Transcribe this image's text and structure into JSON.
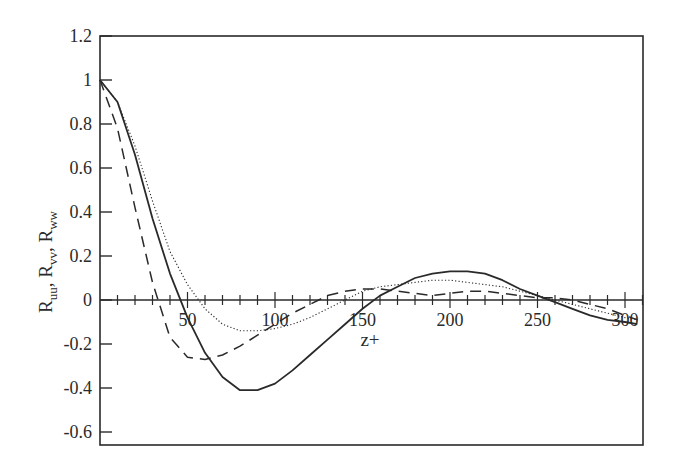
{
  "chart_data": {
    "type": "line",
    "title": "",
    "xlabel": "z+",
    "ylabel": "R_uu, R_vv, R_ww",
    "ylabel_parts": [
      {
        "base": "R",
        "sub": "uu",
        "sep": ", "
      },
      {
        "base": "R",
        "sub": "vv",
        "sep": ", "
      },
      {
        "base": "R",
        "sub": "ww",
        "sep": ""
      }
    ],
    "xlim": [
      0,
      310
    ],
    "ylim": [
      -0.65,
      1.2
    ],
    "grid": false,
    "legend": "none",
    "x_ticks": [
      50,
      100,
      150,
      200,
      250,
      300
    ],
    "x_tick_labels": [
      "50",
      "100",
      "150",
      "200",
      "250",
      "300"
    ],
    "x_minor_tick_step": 10,
    "y_ticks": [
      1.2,
      1.0,
      0.8,
      0.6,
      0.4,
      0.2,
      0,
      -0.2,
      -0.4,
      -0.6
    ],
    "y_tick_labels": [
      "1.2",
      "1",
      "0.8",
      "0.6",
      "0.4",
      "0.2",
      "0",
      "-0.2",
      "-0.4",
      "-0.6"
    ],
    "series": [
      {
        "name": "solid",
        "style": "solid",
        "x": [
          0,
          10,
          20,
          30,
          40,
          50,
          60,
          70,
          80,
          90,
          100,
          110,
          120,
          130,
          140,
          150,
          160,
          170,
          180,
          190,
          200,
          210,
          220,
          230,
          240,
          250,
          260,
          270,
          280,
          290,
          300,
          310
        ],
        "values": [
          1.0,
          0.9,
          0.66,
          0.37,
          0.12,
          -0.08,
          -0.24,
          -0.35,
          -0.41,
          -0.41,
          -0.38,
          -0.32,
          -0.25,
          -0.18,
          -0.11,
          -0.04,
          0.02,
          0.06,
          0.1,
          0.12,
          0.13,
          0.13,
          0.12,
          0.09,
          0.05,
          0.02,
          -0.01,
          -0.04,
          -0.07,
          -0.09,
          -0.1,
          -0.11
        ]
      },
      {
        "name": "dashed",
        "style": "dashed",
        "x": [
          0,
          10,
          20,
          30,
          40,
          50,
          60,
          70,
          80,
          90,
          100,
          110,
          120,
          130,
          140,
          150,
          160,
          170,
          180,
          190,
          200,
          210,
          220,
          230,
          240,
          250,
          260,
          270,
          280,
          290,
          300,
          310
        ],
        "values": [
          1.0,
          0.78,
          0.42,
          0.08,
          -0.17,
          -0.26,
          -0.27,
          -0.25,
          -0.21,
          -0.16,
          -0.11,
          -0.06,
          -0.02,
          0.02,
          0.04,
          0.05,
          0.05,
          0.04,
          0.03,
          0.02,
          0.03,
          0.04,
          0.04,
          0.03,
          0.02,
          0.01,
          0.01,
          0.0,
          -0.02,
          -0.04,
          -0.07,
          -0.09
        ]
      },
      {
        "name": "dotted",
        "style": "dotted",
        "x": [
          0,
          10,
          20,
          30,
          40,
          50,
          60,
          70,
          80,
          90,
          100,
          110,
          120,
          130,
          140,
          150,
          160,
          170,
          180,
          190,
          200,
          210,
          220,
          230,
          240,
          250,
          260,
          270,
          280,
          290,
          300,
          310
        ],
        "values": [
          1.0,
          0.9,
          0.7,
          0.45,
          0.22,
          0.07,
          -0.04,
          -0.11,
          -0.14,
          -0.14,
          -0.13,
          -0.11,
          -0.08,
          -0.04,
          0.0,
          0.04,
          0.06,
          0.07,
          0.08,
          0.09,
          0.09,
          0.08,
          0.07,
          0.06,
          0.04,
          0.02,
          0.0,
          -0.02,
          -0.04,
          -0.06,
          -0.08,
          -0.09
        ]
      }
    ],
    "colors": {
      "line": "#2a2a2a",
      "frame": "#2a2a2a",
      "background": "#ffffff"
    }
  }
}
